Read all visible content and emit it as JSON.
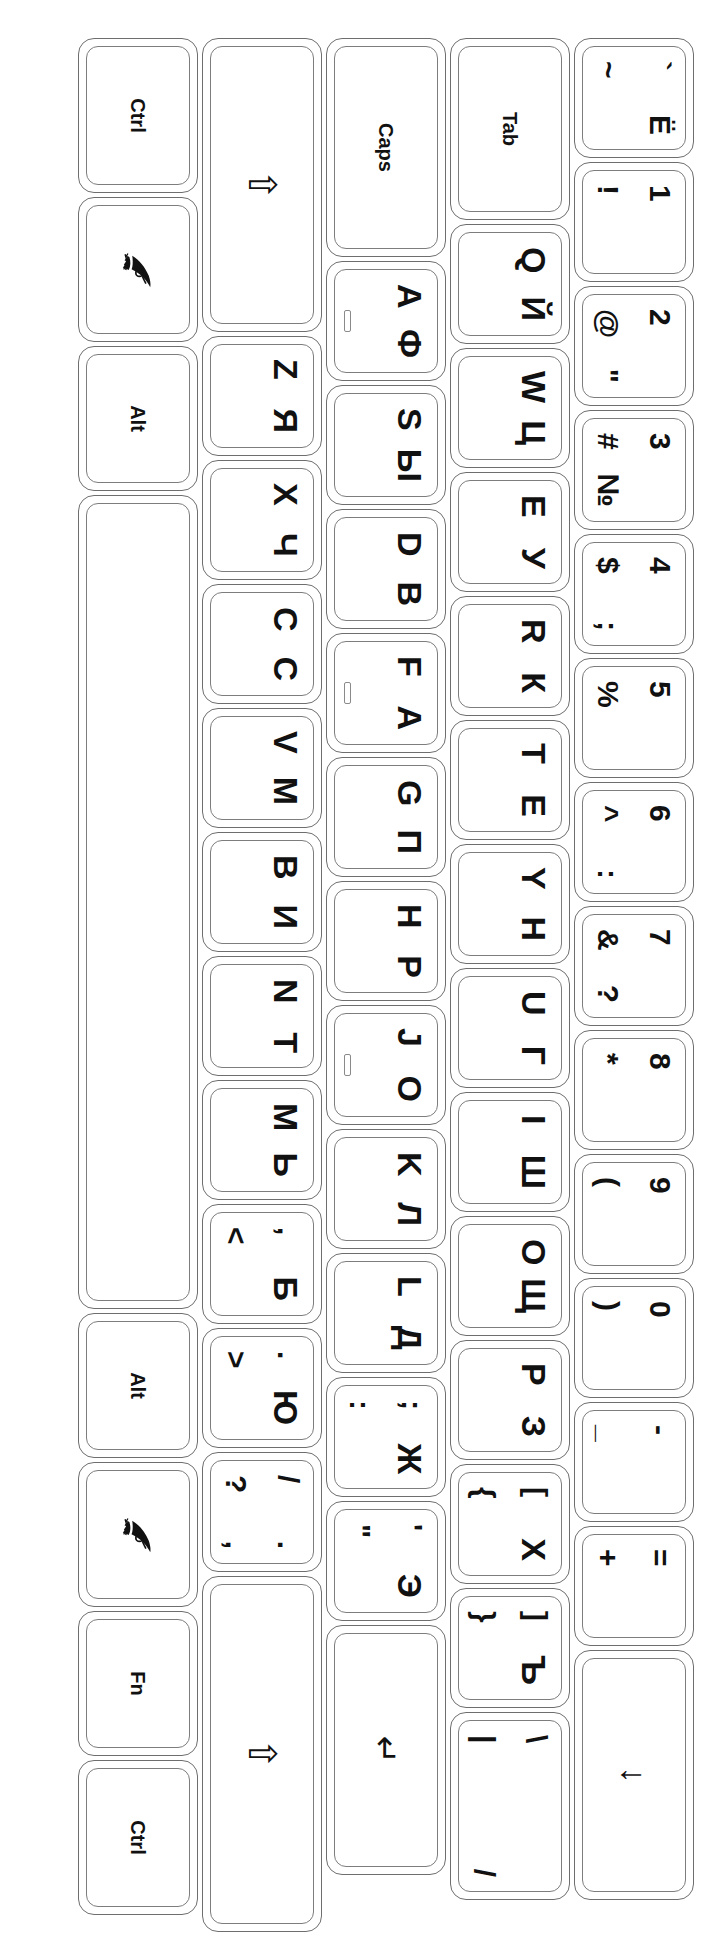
{
  "document": {
    "title": "Russian (Cyrillic) / English Keyboard Layout Sticker Sheet",
    "orientation": "rotated-90",
    "colors": {
      "background": "#ffffff",
      "key_outline": "#6e6e6e",
      "cap_outline": "#7d7d7d",
      "label": "#111111"
    }
  },
  "keyboard": {
    "rows": [
      {
        "name": "number-row",
        "keys": [
          {
            "id": "backquote",
            "latin": "`",
            "latin_shift": "~",
            "cyrillic": "Ё",
            "width": 1,
            "type": "dual-sym"
          },
          {
            "id": "digit1",
            "latin": "1",
            "latin_shift": "!",
            "cyrillic": "",
            "width": 1,
            "type": "num"
          },
          {
            "id": "digit2",
            "latin": "2",
            "latin_shift": "@",
            "cyrillic": "\"",
            "width": 1,
            "type": "num"
          },
          {
            "id": "digit3",
            "latin": "3",
            "latin_shift": "#",
            "cyrillic": "№",
            "width": 1,
            "type": "num"
          },
          {
            "id": "digit4",
            "latin": "4",
            "latin_shift": "$",
            "cyrillic": ";",
            "width": 1,
            "type": "num"
          },
          {
            "id": "digit5",
            "latin": "5",
            "latin_shift": "%",
            "cyrillic": "",
            "width": 1,
            "type": "num"
          },
          {
            "id": "digit6",
            "latin": "6",
            "latin_shift": "^",
            "cyrillic": ":",
            "width": 1,
            "type": "num"
          },
          {
            "id": "digit7",
            "latin": "7",
            "latin_shift": "&",
            "cyrillic": "?",
            "width": 1,
            "type": "num"
          },
          {
            "id": "digit8",
            "latin": "8",
            "latin_shift": "*",
            "cyrillic": "",
            "width": 1,
            "type": "num"
          },
          {
            "id": "digit9",
            "latin": "9",
            "latin_shift": "(",
            "cyrillic": "",
            "width": 1,
            "type": "num"
          },
          {
            "id": "digit0",
            "latin": "0",
            "latin_shift": ")",
            "cyrillic": "",
            "width": 1,
            "type": "num"
          },
          {
            "id": "minus",
            "latin": "-",
            "latin_shift": "_",
            "cyrillic": "",
            "width": 1,
            "type": "num"
          },
          {
            "id": "equal",
            "latin": "=",
            "latin_shift": "+",
            "cyrillic": "",
            "width": 1,
            "type": "num"
          },
          {
            "id": "backspace",
            "label": "",
            "icon": "backspace-arrow",
            "glyph": "↓",
            "width": 2.05,
            "type": "mod"
          }
        ]
      },
      {
        "name": "tab-row",
        "keys": [
          {
            "id": "tab",
            "label": "Tab",
            "width": 1.5,
            "type": "word"
          },
          {
            "id": "keyQ",
            "latin": "Q",
            "cyrillic": "Й",
            "width": 1,
            "type": "letter"
          },
          {
            "id": "keyW",
            "latin": "W",
            "cyrillic": "Ц",
            "width": 1,
            "type": "letter"
          },
          {
            "id": "keyE",
            "latin": "E",
            "cyrillic": "У",
            "width": 1,
            "type": "letter"
          },
          {
            "id": "keyR",
            "latin": "R",
            "cyrillic": "К",
            "width": 1,
            "type": "letter"
          },
          {
            "id": "keyT",
            "latin": "T",
            "cyrillic": "Е",
            "width": 1,
            "type": "letter"
          },
          {
            "id": "keyY",
            "latin": "Y",
            "cyrillic": "Н",
            "width": 1,
            "type": "letter"
          },
          {
            "id": "keyU",
            "latin": "U",
            "cyrillic": "Г",
            "width": 1,
            "type": "letter"
          },
          {
            "id": "keyI",
            "latin": "I",
            "cyrillic": "Ш",
            "width": 1,
            "type": "letter"
          },
          {
            "id": "keyO",
            "latin": "O",
            "cyrillic": "Щ",
            "width": 1,
            "type": "letter"
          },
          {
            "id": "keyP",
            "latin": "P",
            "cyrillic": "З",
            "width": 1,
            "type": "letter"
          },
          {
            "id": "bracketleft",
            "latin": "[",
            "latin_shift": "{",
            "cyrillic": "Х",
            "width": 1,
            "type": "bracket"
          },
          {
            "id": "bracketright",
            "latin": "]",
            "latin_shift": "}",
            "cyrillic": "Ъ",
            "width": 1,
            "type": "bracket"
          },
          {
            "id": "backslash",
            "latin": "\\",
            "latin_shift": "|",
            "cyrillic": "/",
            "width": 1.55,
            "type": "slash"
          }
        ]
      },
      {
        "name": "caps-row",
        "keys": [
          {
            "id": "capslock",
            "label": "Caps",
            "width": 1.8,
            "type": "word"
          },
          {
            "id": "keyA",
            "latin": "A",
            "cyrillic": "Ф",
            "width": 1,
            "type": "letter",
            "notch": true
          },
          {
            "id": "keyS",
            "latin": "S",
            "cyrillic": "Ы",
            "width": 1,
            "type": "letter"
          },
          {
            "id": "keyD",
            "latin": "D",
            "cyrillic": "В",
            "width": 1,
            "type": "letter"
          },
          {
            "id": "keyF",
            "latin": "F",
            "cyrillic": "А",
            "width": 1,
            "type": "letter",
            "notch": true
          },
          {
            "id": "keyG",
            "latin": "G",
            "cyrillic": "П",
            "width": 1,
            "type": "letter"
          },
          {
            "id": "keyH",
            "latin": "H",
            "cyrillic": "Р",
            "width": 1,
            "type": "letter"
          },
          {
            "id": "keyJ",
            "latin": "J",
            "cyrillic": "О",
            "width": 1,
            "type": "letter",
            "notch": true
          },
          {
            "id": "keyK",
            "latin": "K",
            "cyrillic": "Л",
            "width": 1,
            "type": "letter"
          },
          {
            "id": "keyL",
            "latin": "L",
            "cyrillic": "Д",
            "width": 1,
            "type": "letter"
          },
          {
            "id": "semicolon",
            "latin": ";",
            "latin_shift": ":",
            "cyrillic": "Ж",
            "width": 1,
            "type": "punct"
          },
          {
            "id": "quote",
            "latin": "'",
            "latin_shift": "\"",
            "cyrillic": "Э",
            "width": 1,
            "type": "punct"
          },
          {
            "id": "enter",
            "label": "",
            "icon": "enter-arrow",
            "glyph": "↵",
            "width": 2.05,
            "type": "mod"
          }
        ]
      },
      {
        "name": "shift-row",
        "keys": [
          {
            "id": "shiftleft",
            "label": "",
            "icon": "shift-arrow",
            "glyph": "⇧",
            "width": 2.4,
            "type": "mod"
          },
          {
            "id": "keyZ",
            "latin": "Z",
            "cyrillic": "Я",
            "width": 1,
            "type": "letter"
          },
          {
            "id": "keyX",
            "latin": "X",
            "cyrillic": "Ч",
            "width": 1,
            "type": "letter"
          },
          {
            "id": "keyC",
            "latin": "C",
            "cyrillic": "С",
            "width": 1,
            "type": "letter"
          },
          {
            "id": "keyV",
            "latin": "V",
            "cyrillic": "М",
            "width": 1,
            "type": "letter"
          },
          {
            "id": "keyB",
            "latin": "B",
            "cyrillic": "И",
            "width": 1,
            "type": "letter"
          },
          {
            "id": "keyN",
            "latin": "N",
            "cyrillic": "Т",
            "width": 1,
            "type": "letter"
          },
          {
            "id": "keyM",
            "latin": "M",
            "cyrillic": "Ь",
            "width": 1,
            "type": "letter"
          },
          {
            "id": "comma",
            "latin": ",",
            "latin_shift": "<",
            "cyrillic": "Б",
            "width": 1,
            "type": "punct"
          },
          {
            "id": "period",
            "latin": ".",
            "latin_shift": ">",
            "cyrillic": "Ю",
            "width": 1,
            "type": "punct"
          },
          {
            "id": "slash",
            "latin": "/",
            "latin_shift": "?",
            "cyrillic": ".",
            "cyrillic_shift": ",",
            "width": 1,
            "type": "quad"
          },
          {
            "id": "shiftright",
            "label": "",
            "icon": "shift-arrow",
            "glyph": "⇧",
            "width": 2.9,
            "type": "mod"
          }
        ]
      },
      {
        "name": "bottom-row",
        "keys": [
          {
            "id": "ctrlleft",
            "label": "Ctrl",
            "width": 1.28,
            "type": "word"
          },
          {
            "id": "winleft",
            "label": "",
            "icon": "win-flag-icon",
            "width": 1.2,
            "type": "icon"
          },
          {
            "id": "altleft",
            "label": "Alt",
            "width": 1.2,
            "type": "word"
          },
          {
            "id": "space",
            "label": "",
            "width": 6.6,
            "type": "blank"
          },
          {
            "id": "altright",
            "label": "Alt",
            "width": 1.2,
            "type": "word"
          },
          {
            "id": "winright",
            "label": "",
            "icon": "win-flag-icon",
            "width": 1.2,
            "type": "icon"
          },
          {
            "id": "fn",
            "label": "Fn",
            "width": 1.2,
            "type": "word"
          },
          {
            "id": "ctrlright",
            "label": "Ctrl",
            "width": 1.28,
            "type": "word"
          }
        ]
      }
    ]
  }
}
